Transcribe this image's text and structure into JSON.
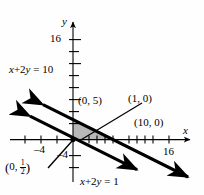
{
  "figure": {
    "type": "coordinate-plane-graph",
    "background_color": "#fefefe",
    "line_color": "#000000",
    "shade_color": "#b8b8b8",
    "axes": {
      "x_axis_label": "x",
      "y_axis_label": "y",
      "x_ticks_labeled": [
        {
          "value": -4,
          "text": "–4"
        },
        {
          "value": 16,
          "text": "16"
        }
      ],
      "y_ticks_labeled": [
        {
          "value": 16,
          "text": "16"
        },
        {
          "value": -4,
          "text": "–4"
        }
      ],
      "x_tick_values": [
        -6,
        -4,
        -2,
        2,
        4,
        6,
        8,
        10,
        12,
        14,
        16,
        18
      ],
      "y_tick_values": [
        -4,
        -2,
        2,
        4,
        6,
        8,
        10,
        12,
        14,
        16,
        18
      ],
      "x_range": [
        -8,
        20
      ],
      "y_range": [
        -6,
        19
      ],
      "tick_step": 2
    },
    "lines": [
      {
        "name": "line-x-plus-2y-equals-10",
        "equation_label": "x + 2y = 10",
        "equation_parts": {
          "lhs_x": "x",
          "plus": "+",
          "coef": "2",
          "var_y": "y",
          "eq": "=",
          "rhs": "10"
        },
        "intercepts": {
          "y_intercept": [
            0,
            5
          ],
          "x_intercept": [
            10,
            0
          ]
        },
        "label_position": "upper-left",
        "arrows": "both-ends"
      },
      {
        "name": "line-x-plus-2y-equals-1",
        "equation_label": "x + 2y = 1",
        "equation_parts": {
          "lhs_x": "x",
          "plus": "+",
          "coef": "2",
          "var_y": "y",
          "eq": "=",
          "rhs": "1"
        },
        "intercepts": {
          "y_intercept": [
            0,
            0.5
          ],
          "x_intercept": [
            1,
            0
          ]
        },
        "label_position": "bottom-center",
        "arrows": "both-ends"
      }
    ],
    "point_labels": [
      {
        "name": "point-label-0-5",
        "text": "(0, 5)",
        "point": [
          0,
          5
        ],
        "leader": false
      },
      {
        "name": "point-label-1-0",
        "text": "(1, 0)",
        "point": [
          1,
          0
        ],
        "leader": true
      },
      {
        "name": "point-label-10-0",
        "text": "(10, 0)",
        "point": [
          10,
          0
        ],
        "leader": false
      },
      {
        "name": "point-label-0-half",
        "text": "(0, 1/2)",
        "point": [
          0,
          0.5
        ],
        "leader": true,
        "render": {
          "open": "(",
          "x": "0,",
          "num": "1",
          "den": "2",
          "close": ")"
        }
      }
    ],
    "shaded_region": {
      "name": "feasible-region",
      "description": "Triangle bounded by the y-axis, the line x + 2y = 1 and the line x + 2y = 10",
      "vertices": [
        [
          0,
          5
        ],
        [
          0,
          0.5
        ],
        [
          10,
          0
        ],
        [
          1,
          0
        ]
      ],
      "fill": "#b8b8b8"
    }
  }
}
